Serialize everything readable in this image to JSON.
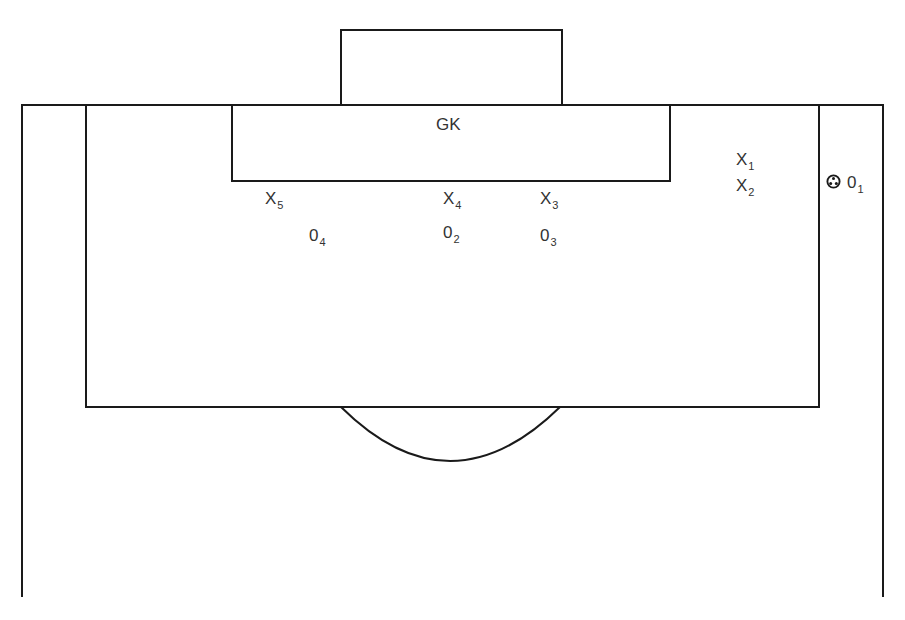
{
  "diagram": {
    "type": "football-set-piece",
    "colors": {
      "line": "#1a1a1a",
      "text": "#333333",
      "background": "#ffffff"
    },
    "goalkeeper": {
      "label": "GK"
    },
    "attackers": [
      {
        "symbol": "X",
        "number": "1"
      },
      {
        "symbol": "X",
        "number": "2"
      },
      {
        "symbol": "X",
        "number": "3"
      },
      {
        "symbol": "X",
        "number": "4"
      },
      {
        "symbol": "X",
        "number": "5"
      }
    ],
    "defenders": [
      {
        "symbol": "0",
        "number": "1",
        "has_ball": true
      },
      {
        "symbol": "0",
        "number": "2"
      },
      {
        "symbol": "0",
        "number": "3"
      },
      {
        "symbol": "0",
        "number": "4"
      }
    ],
    "ball": {
      "icon": "football-icon"
    }
  }
}
